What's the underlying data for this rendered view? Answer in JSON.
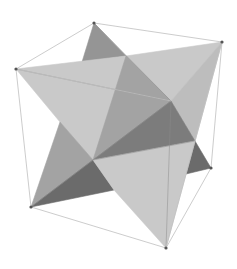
{
  "figure": {
    "width": 237,
    "height": 269,
    "background": "#ffffff"
  },
  "colors": {
    "light": "#c9c9c9",
    "light2": "#bdbdbd",
    "mid": "#a3a3a3",
    "mid2": "#959595",
    "dark": "#7c7c7c",
    "darker": "#6b6b6b",
    "edge": "#8a8a8a",
    "cube_edge": "#bfbfbf",
    "vertex": "#555555"
  },
  "vertices": {
    "top": [
      94,
      23
    ],
    "right_top": [
      222,
      42
    ],
    "left": [
      16,
      69
    ],
    "inner_back": [
      171,
      101
    ],
    "center": [
      93,
      160
    ],
    "right_bottom": [
      211,
      168
    ],
    "bottom_left": [
      31,
      207
    ],
    "bottom": [
      166,
      248
    ]
  },
  "cube_edges": [
    [
      [
        94,
        23
      ],
      [
        222,
        42
      ]
    ],
    [
      [
        94,
        23
      ],
      [
        16,
        69
      ]
    ],
    [
      [
        222,
        42
      ],
      [
        211,
        168
      ]
    ],
    [
      [
        16,
        69
      ],
      [
        31,
        207
      ]
    ],
    [
      [
        31,
        207
      ],
      [
        166,
        248
      ]
    ],
    [
      [
        166,
        248
      ],
      [
        211,
        168
      ]
    ],
    [
      [
        222,
        42
      ],
      [
        166,
        248
      ]
    ],
    [
      [
        16,
        69
      ],
      [
        171,
        101
      ]
    ]
  ],
  "faces": [
    {
      "name": "top-back-dark",
      "points": [
        [
          94,
          23
        ],
        [
          126,
          56
        ],
        [
          82,
          62
        ]
      ],
      "fill": "mid2"
    },
    {
      "name": "upper-left-light",
      "points": [
        [
          16,
          69
        ],
        [
          126,
          56
        ],
        [
          171,
          101
        ],
        [
          93,
          160
        ],
        [
          60,
          122
        ]
      ],
      "fill": "light"
    },
    {
      "name": "upper-right-light",
      "points": [
        [
          126,
          56
        ],
        [
          222,
          42
        ],
        [
          171,
          101
        ]
      ],
      "fill": "light"
    },
    {
      "name": "upper-center-mid",
      "points": [
        [
          126,
          56
        ],
        [
          171,
          101
        ],
        [
          93,
          160
        ]
      ],
      "fill": "mid"
    },
    {
      "name": "right-light",
      "points": [
        [
          222,
          42
        ],
        [
          195,
          141
        ],
        [
          171,
          101
        ]
      ],
      "fill": "light2"
    },
    {
      "name": "center-dark",
      "points": [
        [
          171,
          101
        ],
        [
          195,
          141
        ],
        [
          93,
          160
        ]
      ],
      "fill": "dark"
    },
    {
      "name": "right-bottom-dark",
      "points": [
        [
          195,
          141
        ],
        [
          211,
          168
        ],
        [
          186,
          174
        ]
      ],
      "fill": "darker"
    },
    {
      "name": "left-lower-mid",
      "points": [
        [
          60,
          122
        ],
        [
          93,
          160
        ],
        [
          31,
          207
        ]
      ],
      "fill": "mid"
    },
    {
      "name": "bottom-dark",
      "points": [
        [
          93,
          160
        ],
        [
          114,
          190
        ],
        [
          31,
          207
        ]
      ],
      "fill": "darker"
    },
    {
      "name": "bottom-light",
      "points": [
        [
          93,
          160
        ],
        [
          195,
          141
        ],
        [
          186,
          174
        ],
        [
          166,
          248
        ],
        [
          114,
          190
        ]
      ],
      "fill": "light"
    }
  ],
  "edges": [
    [
      [
        16,
        69
      ],
      [
        171,
        101
      ]
    ],
    [
      [
        171,
        101
      ],
      [
        166,
        248
      ]
    ],
    [
      [
        93,
        160
      ],
      [
        195,
        141
      ]
    ],
    [
      [
        171,
        101
      ],
      [
        31,
        207
      ]
    ],
    [
      [
        94,
        23
      ],
      [
        171,
        101
      ]
    ]
  ]
}
